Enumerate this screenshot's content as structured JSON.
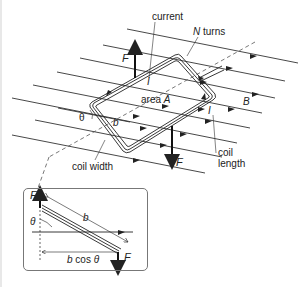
{
  "heading_fragment": "",
  "labels": {
    "current": "current",
    "n_turns_n": "N",
    "n_turns_word": " turns",
    "force_top": "F",
    "current_top": "I",
    "area_word": "area ",
    "area_sym": "A",
    "field": "B",
    "current_right": "I",
    "theta": "θ",
    "b": "b",
    "coil_width": "coil width",
    "coil_length_1": "coil",
    "coil_length_2": "length",
    "force_bottom": "F"
  },
  "inset": {
    "force_top": "F",
    "theta": "θ",
    "b": "b",
    "bcos_b": "b",
    "bcos_rest": " cos ",
    "bcos_theta": "θ",
    "force_bottom": "F"
  },
  "colors": {
    "ink": "#222222",
    "frame": "#777777",
    "background": "#ffffff"
  }
}
